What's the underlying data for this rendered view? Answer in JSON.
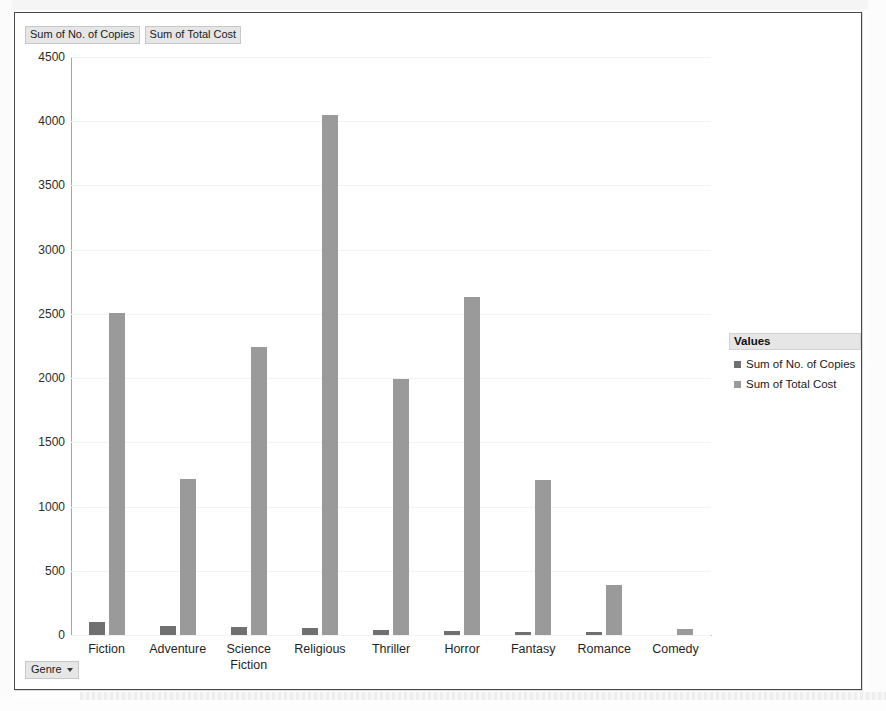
{
  "window": {
    "value_field_buttons": [
      {
        "label": "Sum of No. of Copies"
      },
      {
        "label": "Sum of Total Cost"
      }
    ],
    "axis_field_button": {
      "label": "Genre",
      "caret": "chevron-down-icon"
    }
  },
  "legend": {
    "title": "Values",
    "items": [
      {
        "label": "Sum of No. of Copies",
        "color": "#707070"
      },
      {
        "label": "Sum of Total Cost",
        "color": "#9a9a9a"
      }
    ]
  },
  "chart_data": {
    "type": "bar",
    "title": "",
    "subtitle": "",
    "xlabel": "Genre",
    "ylabel": "",
    "ylim": [
      0,
      4500
    ],
    "yticks": [
      0,
      500,
      1000,
      1500,
      2000,
      2500,
      3000,
      3500,
      4000,
      4500
    ],
    "ytick_labels": [
      "0",
      "500",
      "1000",
      "1500",
      "2000",
      "2500",
      "3000",
      "3500",
      "4000",
      "4500"
    ],
    "grid": true,
    "grid_axis": "y",
    "legend_position": "right",
    "categories": [
      "Fiction",
      "Adventure",
      "Science\nFiction",
      "Religious",
      "Thriller",
      "Horror",
      "Fantasy",
      "Romance",
      "Comedy"
    ],
    "series": [
      {
        "name": "Sum of No. of Copies",
        "color": "#707070",
        "values": [
          100,
          72,
          62,
          58,
          40,
          32,
          25,
          20,
          0
        ]
      },
      {
        "name": "Sum of Total Cost",
        "color": "#9a9a9a",
        "values": [
          2510,
          1215,
          2240,
          4050,
          1995,
          2630,
          1205,
          390,
          50
        ]
      }
    ]
  }
}
